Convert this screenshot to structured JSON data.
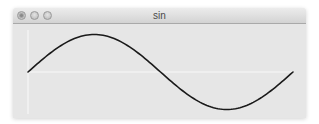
{
  "window": {
    "title": "sin",
    "controls": [
      {
        "name": "close-button",
        "icon": "close-icon"
      },
      {
        "name": "minimize-button",
        "icon": "minimize-icon"
      },
      {
        "name": "zoom-button",
        "icon": "zoom-icon"
      }
    ]
  },
  "colors": {
    "background": "#e6e6e6",
    "axis": "#f5f5f5",
    "curve": "#1a1a1a"
  },
  "chart_data": {
    "type": "line",
    "title": "sin",
    "function": "sin(x)",
    "x_range": [
      0,
      6.283
    ],
    "y_range": [
      -1,
      1
    ],
    "series": [
      {
        "name": "sin",
        "x": [
          0,
          0.785,
          1.571,
          2.356,
          3.142,
          3.927,
          4.712,
          5.498,
          6.283
        ],
        "values": [
          0,
          0.707,
          1,
          0.707,
          0,
          -0.707,
          -1,
          -0.707,
          0
        ]
      }
    ],
    "grid": false,
    "axes_visible": true,
    "tick_labels": false,
    "legend": false
  }
}
